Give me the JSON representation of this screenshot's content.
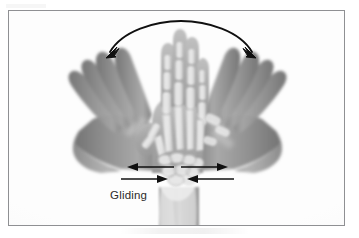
{
  "figure": {
    "kind": "radiograph-illustration",
    "frame_border_color": "#8f9093",
    "background_color": "#ffffff",
    "paper_color": "#fdfdfd"
  },
  "labels": {
    "gliding": "Gliding"
  },
  "annotations": {
    "arc_arrow": {
      "name": "double-headed-arc-arrow",
      "description": "curved double-headed arrow spanning above the fingertips",
      "color": "#111111",
      "heads": 2,
      "direction": "bidirectional"
    },
    "glide_arrows": {
      "name": "gliding-arrow-pairs",
      "color": "#111111",
      "count": 4,
      "items": [
        {
          "side": "left",
          "row": "upper",
          "points": "left"
        },
        {
          "side": "left",
          "row": "lower",
          "points": "right"
        },
        {
          "side": "right",
          "row": "upper",
          "points": "right"
        },
        {
          "side": "right",
          "row": "lower",
          "points": "left"
        }
      ]
    }
  },
  "anatomy": {
    "hands": [
      {
        "name": "hand-left-deviated",
        "position": "left",
        "tone": "#8d8d8d"
      },
      {
        "name": "hand-center-neutral",
        "position": "center",
        "tone": "#a9a9a9"
      },
      {
        "name": "hand-right-deviated",
        "position": "right",
        "tone": "#8d8d8d"
      }
    ],
    "bones": [
      "phalanges",
      "metacarpals",
      "carpals",
      "radius",
      "ulna"
    ],
    "forearm": {
      "name": "forearm",
      "tone": "#b5b5b5"
    }
  }
}
